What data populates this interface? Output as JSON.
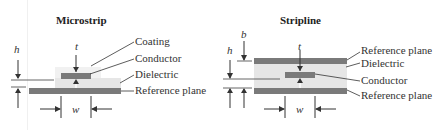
{
  "microstrip": {
    "title": "Microstrip",
    "labels": {
      "coating": "Coating",
      "conductor": "Conductor",
      "dielectric": "Dielectric",
      "reference_plane": "Reference plane"
    },
    "variables": {
      "h": "h",
      "t": "t",
      "w": "w"
    }
  },
  "stripline": {
    "title": "Stripline",
    "labels": {
      "reference_plane_top": "Reference plane",
      "dielectric": "Dielectric",
      "conductor": "Conductor",
      "reference_plane_bottom": "Reference plane"
    },
    "variables": {
      "b": "b",
      "h": "h",
      "t": "t",
      "w": "w"
    }
  },
  "colors": {
    "plane": "#7a7a7a",
    "conductor": "#7a7a7a",
    "dielectric": "#e6e6e6",
    "coating": "#f1f1f1",
    "line": "#333333"
  }
}
